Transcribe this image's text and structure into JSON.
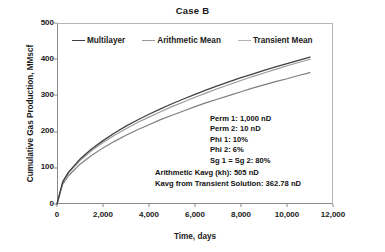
{
  "chart_data": {
    "type": "line",
    "title": "Case B",
    "xlabel": "Time, days",
    "ylabel": "Cumulative Gas Production, MMscf",
    "xlim": [
      0,
      12000
    ],
    "ylim": [
      0,
      500
    ],
    "xticks": [
      "0",
      "2,000",
      "4,000",
      "6,000",
      "8,000",
      "10,000",
      "12,000"
    ],
    "xtick_values": [
      0,
      2000,
      4000,
      6000,
      8000,
      10000,
      12000
    ],
    "yticks": [
      "0",
      "100",
      "200",
      "300",
      "400",
      "500"
    ],
    "ytick_values": [
      0,
      100,
      200,
      300,
      400,
      500
    ],
    "grid": false,
    "legend_position": "top-inside",
    "x": [
      0,
      250,
      500,
      1000,
      1500,
      2000,
      2500,
      3000,
      3500,
      4000,
      4500,
      5000,
      5500,
      6000,
      6500,
      7000,
      7500,
      8000,
      8500,
      9000,
      9500,
      10000,
      10500,
      11000
    ],
    "series": [
      {
        "name": "Multilayer",
        "color": "#404040",
        "values": [
          0,
          62,
          88,
          124,
          152,
          175,
          196,
          215,
          232,
          248,
          263,
          277,
          290,
          303,
          315,
          327,
          338,
          349,
          359,
          369,
          379,
          388,
          397,
          406
        ]
      },
      {
        "name": "Arithmetic Mean",
        "color": "#9a9a9a",
        "values": [
          0,
          60,
          85,
          120,
          147,
          170,
          190,
          208,
          225,
          240,
          255,
          269,
          282,
          295,
          307,
          319,
          330,
          341,
          352,
          362,
          372,
          382,
          391,
          400
        ]
      },
      {
        "name": "Transient Mean",
        "color": "#7d7d7d",
        "values": [
          0,
          55,
          78,
          110,
          134,
          155,
          173,
          190,
          205,
          219,
          233,
          245,
          257,
          269,
          280,
          290,
          300,
          310,
          320,
          329,
          338,
          346,
          355,
          363
        ]
      }
    ],
    "annotations": {
      "block_a": [
        "Perm 1: 1,000 nD",
        "Perm 2: 10 nD",
        "Phi 1: 10%",
        "Phi 2: 6%",
        "Sg 1 = Sg 2: 80%"
      ],
      "block_b": [
        "Arithmetic Kavg (kh): 505 nD",
        "Kavg from Transient Solution: 362.78 nD"
      ]
    }
  }
}
